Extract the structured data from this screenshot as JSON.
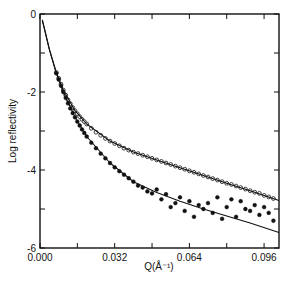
{
  "chart_data": {
    "type": "scatter",
    "title": "",
    "xlabel": "Q(Å⁻¹)",
    "ylabel": "Log reflectivity",
    "xlim": [
      0.0,
      0.1024
    ],
    "ylim": [
      -6,
      0
    ],
    "x_ticks": [
      0.0,
      0.032,
      0.064,
      0.096
    ],
    "x_tick_labels": [
      "0.000",
      "0.032",
      "0.064",
      "0.096"
    ],
    "x_minor_ticks": [
      0.016,
      0.048,
      0.08
    ],
    "y_ticks": [
      0,
      -2,
      -4,
      -6
    ],
    "y_tick_labels": [
      "0",
      "-2",
      "-4",
      "-6"
    ],
    "y_minor_ticks": [
      -1,
      -3,
      -5
    ],
    "grid": false,
    "legend": null,
    "series": [
      {
        "name": "open-circles-data",
        "marker": "open-circle",
        "points": [
          [
            0.007,
            -1.5
          ],
          [
            0.008,
            -1.65
          ],
          [
            0.009,
            -1.8
          ],
          [
            0.01,
            -1.95
          ],
          [
            0.011,
            -2.08
          ],
          [
            0.012,
            -2.2
          ],
          [
            0.013,
            -2.3
          ],
          [
            0.014,
            -2.4
          ],
          [
            0.015,
            -2.48
          ],
          [
            0.016,
            -2.56
          ],
          [
            0.017,
            -2.63
          ],
          [
            0.018,
            -2.7
          ],
          [
            0.019,
            -2.76
          ],
          [
            0.02,
            -2.82
          ],
          [
            0.022,
            -2.93
          ],
          [
            0.024,
            -3.03
          ],
          [
            0.026,
            -3.11
          ],
          [
            0.028,
            -3.19
          ],
          [
            0.03,
            -3.26
          ],
          [
            0.032,
            -3.32
          ],
          [
            0.034,
            -3.38
          ],
          [
            0.036,
            -3.44
          ],
          [
            0.038,
            -3.49
          ],
          [
            0.04,
            -3.54
          ],
          [
            0.042,
            -3.58
          ],
          [
            0.044,
            -3.62
          ],
          [
            0.046,
            -3.66
          ],
          [
            0.048,
            -3.7
          ],
          [
            0.05,
            -3.74
          ],
          [
            0.052,
            -3.78
          ],
          [
            0.054,
            -3.82
          ],
          [
            0.056,
            -3.86
          ],
          [
            0.058,
            -3.9
          ],
          [
            0.06,
            -3.94
          ],
          [
            0.062,
            -3.98
          ],
          [
            0.064,
            -4.02
          ],
          [
            0.066,
            -4.06
          ],
          [
            0.068,
            -4.1
          ],
          [
            0.07,
            -4.14
          ],
          [
            0.072,
            -4.18
          ],
          [
            0.074,
            -4.22
          ],
          [
            0.076,
            -4.26
          ],
          [
            0.078,
            -4.3
          ],
          [
            0.08,
            -4.34
          ],
          [
            0.082,
            -4.37
          ],
          [
            0.084,
            -4.41
          ],
          [
            0.086,
            -4.45
          ],
          [
            0.088,
            -4.49
          ],
          [
            0.09,
            -4.53
          ],
          [
            0.092,
            -4.57
          ],
          [
            0.094,
            -4.6
          ],
          [
            0.096,
            -4.65
          ],
          [
            0.098,
            -4.69
          ],
          [
            0.1,
            -4.73
          ]
        ]
      },
      {
        "name": "filled-circles-data",
        "marker": "filled-circle",
        "points": [
          [
            0.007,
            -1.52
          ],
          [
            0.008,
            -1.68
          ],
          [
            0.009,
            -1.84
          ],
          [
            0.01,
            -2.0
          ],
          [
            0.011,
            -2.15
          ],
          [
            0.012,
            -2.29
          ],
          [
            0.013,
            -2.42
          ],
          [
            0.014,
            -2.54
          ],
          [
            0.015,
            -2.65
          ],
          [
            0.016,
            -2.76
          ],
          [
            0.017,
            -2.86
          ],
          [
            0.018,
            -2.96
          ],
          [
            0.019,
            -3.05
          ],
          [
            0.02,
            -3.14
          ],
          [
            0.022,
            -3.3
          ],
          [
            0.024,
            -3.44
          ],
          [
            0.026,
            -3.58
          ],
          [
            0.028,
            -3.7
          ],
          [
            0.03,
            -3.82
          ],
          [
            0.032,
            -3.93
          ],
          [
            0.034,
            -4.03
          ],
          [
            0.036,
            -4.12
          ],
          [
            0.038,
            -4.21
          ],
          [
            0.04,
            -4.3
          ],
          [
            0.042,
            -4.4
          ],
          [
            0.044,
            -4.45
          ],
          [
            0.046,
            -4.55
          ],
          [
            0.048,
            -4.6
          ],
          [
            0.05,
            -4.5
          ],
          [
            0.052,
            -4.75
          ],
          [
            0.054,
            -4.62
          ],
          [
            0.056,
            -4.95
          ],
          [
            0.058,
            -4.85
          ],
          [
            0.06,
            -4.7
          ],
          [
            0.062,
            -5.05
          ],
          [
            0.064,
            -4.8
          ],
          [
            0.066,
            -5.2
          ],
          [
            0.068,
            -4.9
          ],
          [
            0.07,
            -5.0
          ],
          [
            0.072,
            -4.85
          ],
          [
            0.074,
            -5.1
          ],
          [
            0.076,
            -4.7
          ],
          [
            0.078,
            -5.25
          ],
          [
            0.08,
            -4.95
          ],
          [
            0.082,
            -4.75
          ],
          [
            0.084,
            -5.2
          ],
          [
            0.086,
            -4.8
          ],
          [
            0.088,
            -5.0
          ],
          [
            0.09,
            -5.05
          ],
          [
            0.092,
            -4.9
          ],
          [
            0.094,
            -5.15
          ],
          [
            0.096,
            -4.95
          ],
          [
            0.098,
            -5.1
          ],
          [
            0.1,
            -5.3
          ]
        ]
      },
      {
        "name": "fit-upper",
        "marker": "line",
        "points": [
          [
            0.001,
            -0.15
          ],
          [
            0.004,
            -0.9
          ],
          [
            0.007,
            -1.5
          ],
          [
            0.01,
            -1.95
          ],
          [
            0.015,
            -2.48
          ],
          [
            0.02,
            -2.82
          ],
          [
            0.03,
            -3.26
          ],
          [
            0.04,
            -3.54
          ],
          [
            0.05,
            -3.74
          ],
          [
            0.06,
            -3.94
          ],
          [
            0.07,
            -4.14
          ],
          [
            0.08,
            -4.34
          ],
          [
            0.09,
            -4.53
          ],
          [
            0.1024,
            -4.78
          ]
        ]
      },
      {
        "name": "fit-lower",
        "marker": "line",
        "points": [
          [
            0.001,
            -0.15
          ],
          [
            0.004,
            -0.9
          ],
          [
            0.007,
            -1.52
          ],
          [
            0.01,
            -2.0
          ],
          [
            0.015,
            -2.65
          ],
          [
            0.02,
            -3.14
          ],
          [
            0.03,
            -3.82
          ],
          [
            0.04,
            -4.3
          ],
          [
            0.05,
            -4.58
          ],
          [
            0.06,
            -4.8
          ],
          [
            0.07,
            -5.0
          ],
          [
            0.08,
            -5.18
          ],
          [
            0.09,
            -5.36
          ],
          [
            0.1024,
            -5.6
          ]
        ]
      }
    ]
  }
}
